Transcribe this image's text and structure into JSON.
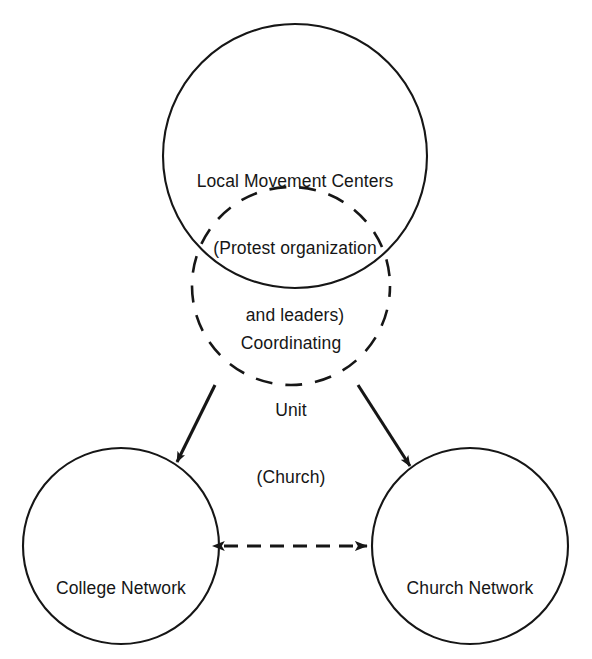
{
  "diagram": {
    "background_color": "#ffffff",
    "stroke_color": "#161616",
    "nodes": [
      {
        "id": "local-movement-centers",
        "label_lines": [
          "Local Movement Centers",
          "(Protest organization",
          "and leaders)"
        ],
        "line1": "Local Movement Centers",
        "line2": "(Protest organization",
        "line3": "and leaders)",
        "shape": "circle",
        "border_style": "solid",
        "cx": 295,
        "cy": 156,
        "r": 132
      },
      {
        "id": "coordinating-unit",
        "label_lines": [
          "Coordinating",
          "Unit",
          "(Church)"
        ],
        "line1": "Coordinating",
        "line2": "Unit",
        "line3": "(Church)",
        "shape": "circle",
        "border_style": "dashed",
        "cx": 291,
        "cy": 286,
        "r": 99
      },
      {
        "id": "college-network",
        "label_lines": [
          "College Network"
        ],
        "line1": "College Network",
        "shape": "circle",
        "border_style": "solid",
        "cx": 121,
        "cy": 546,
        "r": 98
      },
      {
        "id": "church-network",
        "label_lines": [
          "Church Network"
        ],
        "line1": "Church Network",
        "shape": "circle",
        "border_style": "solid",
        "cx": 470,
        "cy": 546,
        "r": 98
      }
    ],
    "edges": [
      {
        "id": "cu-to-college",
        "from": "coordinating-unit",
        "to": "college-network",
        "style": "solid",
        "arrow": "single",
        "direction": "down-left"
      },
      {
        "id": "cu-to-church",
        "from": "coordinating-unit",
        "to": "church-network",
        "style": "solid",
        "arrow": "single",
        "direction": "down-right"
      },
      {
        "id": "college-church",
        "from": "college-network",
        "to": "church-network",
        "style": "dashed",
        "arrow": "double",
        "direction": "horizontal"
      }
    ]
  }
}
